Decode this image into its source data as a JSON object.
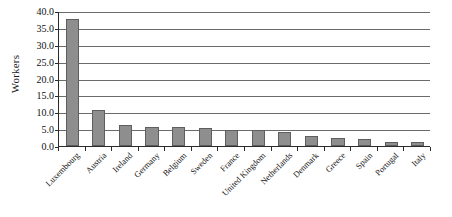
{
  "chart_data": {
    "type": "bar",
    "title": "",
    "xlabel": "",
    "ylabel": "Workers",
    "ylim": [
      0.0,
      40.0
    ],
    "ytick_step": 5.0,
    "grid": true,
    "legend": "none",
    "bar_color": "#8e8e8e",
    "bar_border_color": "#5e5e5e",
    "axis_color": "#2b2b2b",
    "gridline_color": "#6b6b6b",
    "categories": [
      "Luxembourg",
      "Austria",
      "Ireland",
      "Germany",
      "Belgium",
      "Sweden",
      "France",
      "United Kingdom",
      "Netherlands",
      "Denmark",
      "Greece",
      "Spain",
      "Portugal",
      "Italy"
    ],
    "values": [
      37.5,
      10.6,
      6.3,
      5.6,
      5.5,
      5.3,
      4.8,
      4.6,
      4.2,
      3.0,
      2.4,
      2.0,
      1.3,
      1.2
    ],
    "ytick_labels": [
      "0.0",
      "5.0",
      "10.0",
      "15.0",
      "20.0",
      "25.0",
      "30.0",
      "35.0",
      "40.0"
    ],
    "ytick_values": [
      0.0,
      5.0,
      10.0,
      15.0,
      20.0,
      25.0,
      30.0,
      35.0,
      40.0
    ]
  }
}
